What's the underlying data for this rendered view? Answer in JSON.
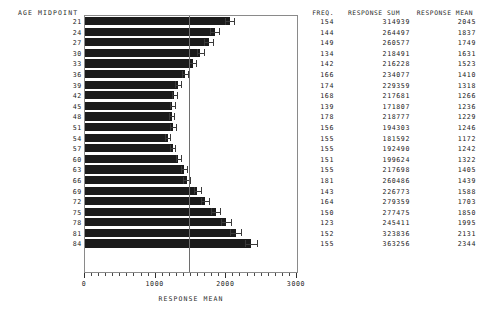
{
  "chart_data": {
    "type": "bar",
    "title": "",
    "orientation": "horizontal",
    "xlabel": "RESPONSE MEAN",
    "ylabel": "AGE MIDPOINT",
    "xlim": [
      0,
      3000
    ],
    "xticks": [
      0,
      1000,
      2000,
      3000
    ],
    "xtick_labels": [
      "0",
      "1000",
      "2000",
      "3000"
    ],
    "grid": false,
    "legend": false,
    "reference_line": 1470,
    "categories": [
      21,
      24,
      27,
      30,
      33,
      36,
      39,
      42,
      45,
      48,
      51,
      54,
      57,
      60,
      63,
      66,
      69,
      72,
      75,
      78,
      81,
      84
    ],
    "values": [
      2045,
      1837,
      1749,
      1631,
      1523,
      1410,
      1318,
      1266,
      1236,
      1229,
      1246,
      1172,
      1242,
      1322,
      1405,
      1439,
      1588,
      1703,
      1850,
      1995,
      2131,
      2344
    ],
    "errors": [
      70,
      62,
      58,
      52,
      48,
      44,
      40,
      38,
      36,
      36,
      37,
      34,
      37,
      40,
      44,
      46,
      52,
      58,
      64,
      70,
      76,
      84
    ]
  },
  "plot": {
    "axis_title": "AGE MIDPOINT",
    "x_axis_title": "RESPONSE MEAN"
  },
  "table": {
    "headers": {
      "freq": "FREQ.",
      "sum": "RESPONSE SUM",
      "mean": "RESPONSE MEAN"
    },
    "rows": [
      {
        "age": "21",
        "freq": "154",
        "sum": "314939",
        "mean": "2045"
      },
      {
        "age": "24",
        "freq": "144",
        "sum": "264497",
        "mean": "1837"
      },
      {
        "age": "27",
        "freq": "149",
        "sum": "260577",
        "mean": "1749"
      },
      {
        "age": "30",
        "freq": "134",
        "sum": "218491",
        "mean": "1631"
      },
      {
        "age": "33",
        "freq": "142",
        "sum": "216228",
        "mean": "1523"
      },
      {
        "age": "36",
        "freq": "166",
        "sum": "234077",
        "mean": "1410"
      },
      {
        "age": "39",
        "freq": "174",
        "sum": "229359",
        "mean": "1318"
      },
      {
        "age": "42",
        "freq": "168",
        "sum": "217681",
        "mean": "1266"
      },
      {
        "age": "45",
        "freq": "139",
        "sum": "171807",
        "mean": "1236"
      },
      {
        "age": "48",
        "freq": "178",
        "sum": "218777",
        "mean": "1229"
      },
      {
        "age": "51",
        "freq": "156",
        "sum": "194303",
        "mean": "1246"
      },
      {
        "age": "54",
        "freq": "155",
        "sum": "181592",
        "mean": "1172"
      },
      {
        "age": "57",
        "freq": "155",
        "sum": "192490",
        "mean": "1242"
      },
      {
        "age": "60",
        "freq": "151",
        "sum": "199624",
        "mean": "1322"
      },
      {
        "age": "63",
        "freq": "155",
        "sum": "217698",
        "mean": "1405"
      },
      {
        "age": "66",
        "freq": "181",
        "sum": "260486",
        "mean": "1439"
      },
      {
        "age": "69",
        "freq": "143",
        "sum": "226773",
        "mean": "1588"
      },
      {
        "age": "72",
        "freq": "164",
        "sum": "279359",
        "mean": "1703"
      },
      {
        "age": "75",
        "freq": "150",
        "sum": "277475",
        "mean": "1850"
      },
      {
        "age": "78",
        "freq": "123",
        "sum": "245411",
        "mean": "1995"
      },
      {
        "age": "81",
        "freq": "152",
        "sum": "323836",
        "mean": "2131"
      },
      {
        "age": "84",
        "freq": "155",
        "sum": "363256",
        "mean": "2344"
      }
    ]
  },
  "colors": {
    "bar": "#1b1b1b",
    "frame": "#8a8a8a",
    "reference_line": "#6e6e6e",
    "text": "#222222"
  }
}
